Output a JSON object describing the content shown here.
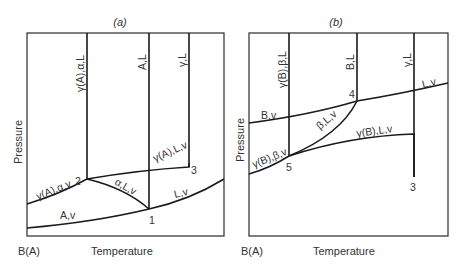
{
  "panels": [
    {
      "id": "a",
      "title": "(a)",
      "ylabel": "Pressure",
      "xlabel": "Temperature",
      "origin_label": "B(A)",
      "vertical_region_labels": [
        "γ(A),α,L",
        "A,L",
        "γ,L"
      ],
      "curve_labels": {
        "gamma_alpha_v": "γ(A),α,v",
        "alpha_L_v": "α,L,v",
        "gamma_L_v": "γ(A),L,v",
        "L_v": "L,v",
        "A_v": "A,v"
      },
      "points": {
        "p1": "1",
        "p2": "2",
        "p3": "3"
      }
    },
    {
      "id": "b",
      "title": "(b)",
      "ylabel": "Pressure",
      "xlabel": "Temperature",
      "origin_label": "B(A)",
      "vertical_region_labels": [
        "γ(B),β,L",
        "B,L",
        "γ,L"
      ],
      "curve_labels": {
        "B_v": "B,v",
        "L_v": "L,v",
        "beta_L_v": "β,L,v",
        "gamma_L_v": "γ(B),L,v",
        "gamma_beta_v": "γ(B),β,v"
      },
      "points": {
        "p4": "4",
        "p5": "5",
        "p3": "3"
      }
    }
  ]
}
